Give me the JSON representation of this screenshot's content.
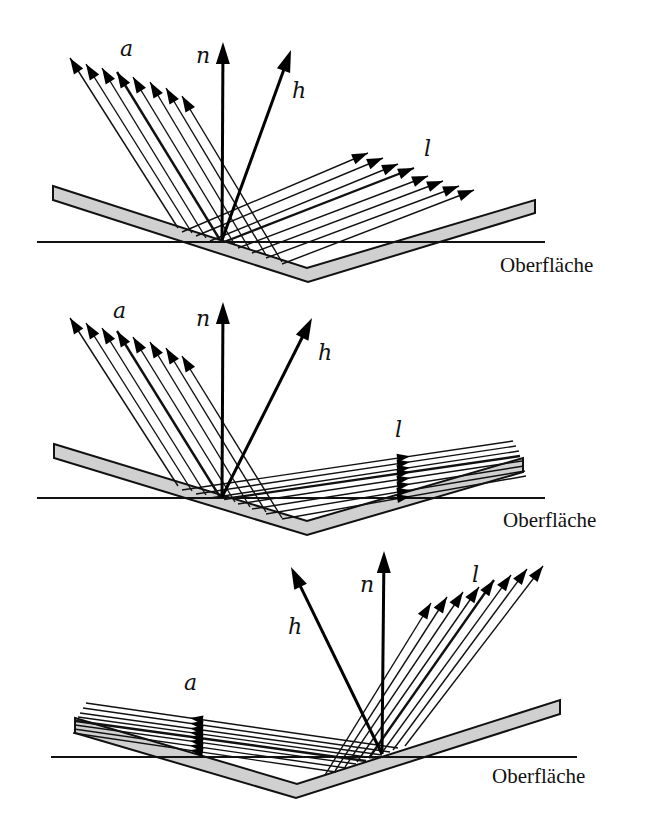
{
  "figure": {
    "surface_label": "Oberfläche",
    "colors": {
      "ink": "#111111",
      "slab_fill": "#d0d0d0",
      "background": "#ffffff"
    }
  },
  "panels": [
    {
      "id": "panel-1",
      "labels": {
        "a": {
          "text": "a",
          "x": 120,
          "y": 56
        },
        "n": {
          "text": "n",
          "x": 196,
          "y": 63
        },
        "h": {
          "text": "h",
          "x": 292,
          "y": 98
        },
        "l": {
          "text": "l",
          "x": 424,
          "y": 156
        },
        "surface": {
          "text": "Oberfläche",
          "x": 500,
          "y": 272
        }
      },
      "hline": {
        "x1": 37,
        "x2": 545,
        "y": 242
      },
      "slab": [
        [
          53,
          186
        ],
        [
          307,
          268
        ],
        [
          535,
          200
        ],
        [
          535,
          213
        ],
        [
          308,
          282
        ],
        [
          53,
          200
        ]
      ],
      "origin": [
        222,
        240
      ],
      "n_tip": [
        223,
        42
      ],
      "h_tip": [
        291,
        50
      ],
      "a_tips": [
        [
          70,
          58
        ],
        [
          86,
          64
        ],
        [
          102,
          68
        ],
        [
          117,
          72
        ],
        [
          133,
          77
        ],
        [
          150,
          82
        ],
        [
          166,
          88
        ],
        [
          182,
          96
        ]
      ],
      "a_bases": [
        [
          178,
          228
        ],
        [
          192,
          233
        ],
        [
          206,
          238
        ],
        [
          220,
          240
        ],
        [
          235,
          245
        ],
        [
          250,
          250
        ],
        [
          266,
          255
        ],
        [
          282,
          262
        ]
      ],
      "l_tips": [
        [
          368,
          153
        ],
        [
          383,
          158
        ],
        [
          398,
          164
        ],
        [
          414,
          168
        ],
        [
          428,
          176
        ],
        [
          443,
          181
        ],
        [
          459,
          186
        ],
        [
          474,
          190
        ]
      ],
      "l_bases": [
        [
          182,
          232
        ],
        [
          196,
          236
        ],
        [
          210,
          241
        ],
        [
          224,
          242
        ],
        [
          238,
          248
        ],
        [
          252,
          253
        ],
        [
          266,
          258
        ],
        [
          282,
          264
        ]
      ],
      "thick_index": 3
    },
    {
      "id": "panel-2",
      "labels": {
        "a": {
          "text": "a",
          "x": 113,
          "y": 318
        },
        "n": {
          "text": "n",
          "x": 196,
          "y": 326
        },
        "h": {
          "text": "h",
          "x": 318,
          "y": 360
        },
        "l": {
          "text": "l",
          "x": 395,
          "y": 437
        },
        "surface": {
          "text": "Oberfläche",
          "x": 503,
          "y": 527
        }
      },
      "hline": {
        "x1": 37,
        "x2": 545,
        "y": 498
      },
      "slab": [
        [
          54,
          444
        ],
        [
          307,
          521
        ],
        [
          523,
          458
        ],
        [
          523,
          472
        ],
        [
          307,
          535
        ],
        [
          54,
          458
        ]
      ],
      "origin": [
        222,
        497
      ],
      "n_tip": [
        223,
        302
      ],
      "h_tip": [
        312,
        318
      ],
      "a_tips": [
        [
          70,
          318
        ],
        [
          86,
          323
        ],
        [
          102,
          328
        ],
        [
          117,
          331
        ],
        [
          133,
          337
        ],
        [
          150,
          342
        ],
        [
          166,
          348
        ],
        [
          182,
          356
        ]
      ],
      "a_bases": [
        [
          178,
          486
        ],
        [
          192,
          491
        ],
        [
          206,
          495
        ],
        [
          220,
          497
        ],
        [
          235,
          502
        ],
        [
          250,
          507
        ],
        [
          266,
          512
        ],
        [
          282,
          518
        ]
      ],
      "l_tips": [
        [
          513,
          441
        ],
        [
          516,
          446
        ],
        [
          519,
          451
        ],
        [
          520,
          456
        ],
        [
          522,
          461
        ],
        [
          524,
          466
        ],
        [
          525,
          471
        ],
        [
          526,
          476
        ]
      ],
      "l_bases": [
        [
          182,
          490
        ],
        [
          196,
          494
        ],
        [
          210,
          498
        ],
        [
          224,
          499
        ],
        [
          238,
          504
        ],
        [
          252,
          509
        ],
        [
          266,
          514
        ],
        [
          282,
          519
        ]
      ],
      "l_head_x": 410,
      "thick_index": 3
    },
    {
      "id": "panel-3",
      "labels": {
        "a": {
          "text": "a",
          "x": 184,
          "y": 690
        },
        "n": {
          "text": "n",
          "x": 360,
          "y": 592
        },
        "h": {
          "text": "h",
          "x": 288,
          "y": 634
        },
        "l": {
          "text": "l",
          "x": 472,
          "y": 582
        },
        "surface": {
          "text": "Oberfläche",
          "x": 492,
          "y": 783
        }
      },
      "hline": {
        "x1": 51,
        "x2": 577,
        "y": 757
      },
      "slab": [
        [
          75,
          718
        ],
        [
          297,
          784
        ],
        [
          560,
          700
        ],
        [
          560,
          714
        ],
        [
          296,
          798
        ],
        [
          75,
          733
        ]
      ],
      "origin": [
        382,
        754
      ],
      "n_tip": [
        384,
        551
      ],
      "h_tip": [
        291,
        567
      ],
      "a_tips": [
        [
          86,
          703
        ],
        [
          83,
          708
        ],
        [
          80,
          713
        ],
        [
          78,
          717
        ],
        [
          76,
          721
        ],
        [
          75,
          725
        ],
        [
          74,
          729
        ],
        [
          73,
          733
        ]
      ],
      "a_bases": [
        [
          398,
          748
        ],
        [
          390,
          752
        ],
        [
          382,
          755
        ],
        [
          374,
          758
        ],
        [
          366,
          761
        ],
        [
          356,
          764
        ],
        [
          346,
          768
        ],
        [
          336,
          772
        ]
      ],
      "a_head_x": 190,
      "l_tips": [
        [
          431,
          603
        ],
        [
          447,
          597
        ],
        [
          463,
          592
        ],
        [
          479,
          587
        ],
        [
          494,
          580
        ],
        [
          511,
          575
        ],
        [
          527,
          569
        ],
        [
          543,
          566
        ]
      ],
      "l_bases": [
        [
          325,
          775
        ],
        [
          335,
          771
        ],
        [
          345,
          767
        ],
        [
          357,
          762
        ],
        [
          369,
          758
        ],
        [
          381,
          754
        ],
        [
          393,
          750
        ],
        [
          405,
          746
        ]
      ],
      "thick_index": 4
    }
  ]
}
